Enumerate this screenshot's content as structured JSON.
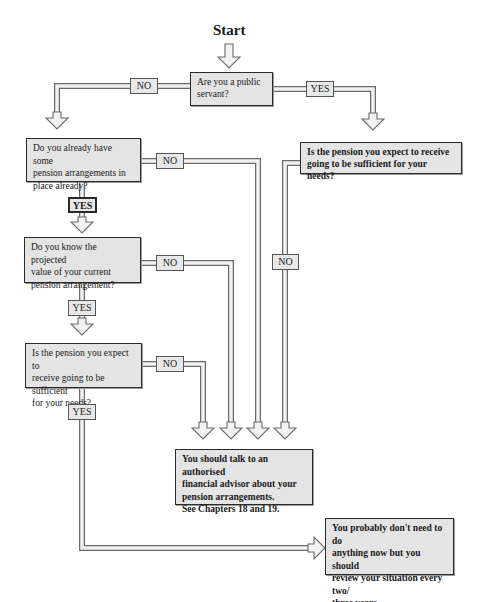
{
  "title": "Start",
  "nodes": {
    "q_public_servant": "Are you a public\nservant?",
    "q_existing_arrangements": "Do you already have some\npension arrangements in\nplace already?",
    "q_know_projected_value": "Do you know the projected\nvalue of your current\npension arrangement?",
    "q_sufficient_left": "Is the pension you expect to\nreceive going to be sufficient\nfor your needs?",
    "q_sufficient_right": "Is the pension you expect to receive\ngoing to be sufficient for your needs?",
    "outcome_talk_advisor": "You should talk to an authorised\nfinancial advisor about your\npension arrangements.\nSee Chapters 18 and 19.",
    "outcome_no_action": "You probably don't need to do\nanything now but you should\nreview your situation every two/\nthree years."
  },
  "edges": {
    "public_no": "NO",
    "public_yes": "YES",
    "existing_no": "NO",
    "existing_yes": "YES",
    "projected_no": "NO",
    "projected_yes": "YES",
    "sufficient_left_no": "NO",
    "sufficient_left_yes": "YES",
    "sufficient_right_no": "NO"
  },
  "colors": {
    "box_fill": "#e4e4e4",
    "box_border": "#2a2a2a",
    "pipe_fill": "#ececec",
    "pipe_border": "#6a6a6a"
  }
}
